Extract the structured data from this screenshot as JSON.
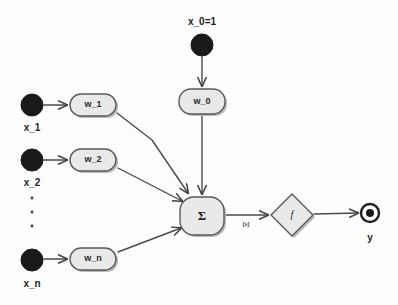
{
  "diagram": {
    "colors": {
      "background": "#fdfdfd",
      "node_fill": "#e9e9e9",
      "node_stroke": "#5a5a5a",
      "edge_stroke": "#4a4a4a",
      "input_dot": "#1a1a1a",
      "shadow": "#b9b9b9",
      "text": "#232323"
    },
    "inputs": [
      {
        "id": "x0",
        "label": "x_0=1",
        "label_pos": "above",
        "cx": 202,
        "cy": 45,
        "r": 11
      },
      {
        "id": "x1",
        "label": "x_1",
        "label_pos": "below",
        "cx": 32,
        "cy": 105,
        "r": 11
      },
      {
        "id": "x2",
        "label": "x_2",
        "label_pos": "below",
        "cx": 32,
        "cy": 160,
        "r": 11
      },
      {
        "id": "xn",
        "label": "x_n",
        "label_pos": "below",
        "cx": 32,
        "cy": 260,
        "r": 11
      }
    ],
    "weights": [
      {
        "id": "w0",
        "label": "w_0",
        "cx": 202,
        "cy": 101,
        "w": 46,
        "h": 25
      },
      {
        "id": "w1",
        "label": "w_1",
        "cx": 93,
        "cy": 105,
        "w": 46,
        "h": 22
      },
      {
        "id": "w2",
        "label": "w_2",
        "cx": 93,
        "cy": 160,
        "w": 46,
        "h": 22
      },
      {
        "id": "wn",
        "label": "w_n",
        "cx": 93,
        "cy": 259,
        "w": 46,
        "h": 22
      }
    ],
    "summation": {
      "id": "sum",
      "label": "Σ",
      "cx": 202,
      "cy": 216,
      "w": 44,
      "h": 38
    },
    "activation": {
      "id": "f",
      "label": "f",
      "cx": 292,
      "cy": 215,
      "w": 42,
      "h": 42
    },
    "output": {
      "id": "y",
      "label": "y",
      "cx": 370,
      "cy": 213,
      "r_outer": 9,
      "r_inner": 4
    },
    "edge_labels": [
      {
        "id": "sum-to-f",
        "label": "[s]",
        "x": 246,
        "y": 224
      }
    ],
    "ellipsis": {
      "id": "vertical-ellipsis",
      "text": "⋮",
      "dots": 3,
      "x": 32,
      "y_start": 196,
      "spacing": 14
    },
    "edges": [
      {
        "from": "x0",
        "to": "w0"
      },
      {
        "from": "x1",
        "to": "w1"
      },
      {
        "from": "x2",
        "to": "w2"
      },
      {
        "from": "xn",
        "to": "wn"
      },
      {
        "from": "w0",
        "to": "sum"
      },
      {
        "from": "w1",
        "to": "sum"
      },
      {
        "from": "w2",
        "to": "sum"
      },
      {
        "from": "wn",
        "to": "sum"
      },
      {
        "from": "sum",
        "to": "f",
        "label": "[s]"
      },
      {
        "from": "f",
        "to": "y"
      }
    ]
  }
}
